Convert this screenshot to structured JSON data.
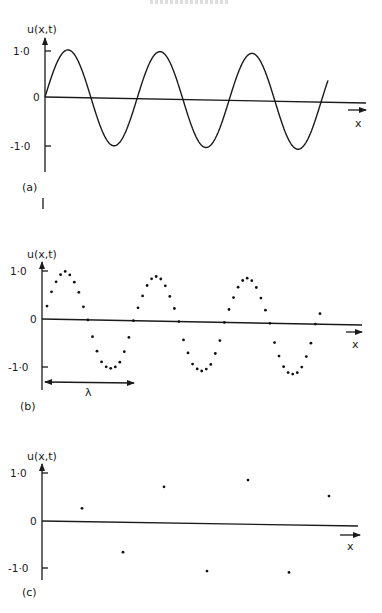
{
  "figure": {
    "header_fragment": "",
    "panels": [
      {
        "id": "a",
        "label": "(a)",
        "ylabel": "u(x,t)",
        "xlabel": "x",
        "yticks": [
          "1·0",
          "0",
          "-1·0"
        ],
        "style": "continuous"
      },
      {
        "id": "b",
        "label": "(b)",
        "ylabel": "u(x,t)",
        "xlabel": "x",
        "yticks": [
          "1·0",
          "0",
          "-1·0"
        ],
        "style": "dense-samples",
        "annotation": "λ"
      },
      {
        "id": "c",
        "label": "(c)",
        "ylabel": "u(x,t)",
        "xlabel": "x",
        "yticks": [
          "1·0",
          "0",
          "-1·0"
        ],
        "style": "sparse-samples (aliased)"
      }
    ]
  },
  "chart_data": [
    {
      "type": "line",
      "title": "(a)",
      "xlabel": "x",
      "ylabel": "u(x,t)",
      "ylim": [
        -1.0,
        1.0
      ],
      "yticks": [
        1.0,
        0,
        -1.0
      ],
      "grid": false,
      "description": "Continuous sinusoid, amplitude 1.0, ~3.5 wavelengths starting at u=0",
      "series": [
        {
          "name": "u(x,t)",
          "function": "sin(2*pi*x/lambda)",
          "amplitude": 1.0,
          "cycles": 3.55
        }
      ],
      "px": {
        "x0": 45,
        "y_one": 51,
        "y_zero": 97,
        "y_minus_one": 146,
        "period_px": 92,
        "x_end_curve": 328,
        "x_axis_end": 366,
        "label_y": 187
      }
    },
    {
      "type": "scatter",
      "title": "(b)",
      "xlabel": "x",
      "ylabel": "u(x,t)",
      "ylim": [
        -1.0,
        1.0
      ],
      "yticks": [
        1.0,
        0,
        -1.0
      ],
      "annotation": "λ (one wavelength, arrow below axis)",
      "description": "Sinusoid sampled densely (~20 samples per wavelength)",
      "series": [
        {
          "name": "samples",
          "values": [
            0.27,
            0.57,
            0.78,
            0.93,
            1.0,
            0.93,
            0.78,
            0.57,
            0.27,
            0.0,
            -0.35,
            -0.65,
            -0.87,
            -0.97,
            -1.0,
            -0.97,
            -0.87,
            -0.65,
            -0.35,
            0.0,
            0.27,
            0.52,
            0.74,
            0.88,
            0.93,
            0.88,
            0.74,
            0.52,
            0.27,
            0.0,
            -0.38,
            -0.65,
            -0.88,
            -0.98,
            -1.02,
            -0.98,
            -0.88,
            -0.65,
            -0.38,
            0.0,
            0.27,
            0.52,
            0.74,
            0.88,
            0.93,
            0.88,
            0.74,
            0.52,
            0.27,
            0.0,
            -0.4,
            -0.68,
            -0.9,
            -1.02,
            -1.05,
            -1.02,
            -0.9,
            -0.68,
            -0.4,
            0.0,
            0.22
          ]
        }
      ],
      "px": {
        "x0": 42,
        "x_first": 47,
        "dx": 4.55,
        "y_one": 271,
        "y_zero": 319,
        "y_minus_one": 367,
        "x_axis_end": 362,
        "lambda_y": 382,
        "lambda_x1": 43,
        "lambda_x2": 135,
        "label_y": 408
      }
    },
    {
      "type": "scatter",
      "title": "(c)",
      "xlabel": "x",
      "ylabel": "u(x,t)",
      "ylim": [
        -1.0,
        1.0
      ],
      "yticks": [
        1.0,
        0,
        -1.0
      ],
      "description": "Same sinusoid sampled sparsely (aliased)",
      "series": [
        {
          "name": "samples",
          "x_px": [
            82,
            123,
            164,
            207,
            248,
            289,
            329
          ],
          "values": [
            0.28,
            -0.63,
            0.76,
            -1.0,
            0.93,
            -1.0,
            0.62
          ]
        }
      ],
      "px": {
        "x0": 42,
        "y_one": 473,
        "y_zero": 521,
        "y_minus_one": 568,
        "x_axis_end": 358,
        "label_y": 593
      }
    }
  ]
}
